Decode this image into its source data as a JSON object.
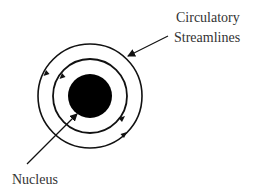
{
  "diagram": {
    "labels": {
      "streamlines_line1": "Circulatory",
      "streamlines_line2": "Streamlines",
      "nucleus": "Nucleus"
    },
    "elements": {
      "center": [
        90,
        96
      ],
      "nucleus_radius": 22,
      "inner_streamline_radius": 37,
      "outer_streamline_radius": 52,
      "flow_direction": "clockwise"
    },
    "colors": {
      "stroke": "#111111",
      "nucleus_fill": "#000000",
      "text": "#333333",
      "background": "#ffffff"
    }
  }
}
